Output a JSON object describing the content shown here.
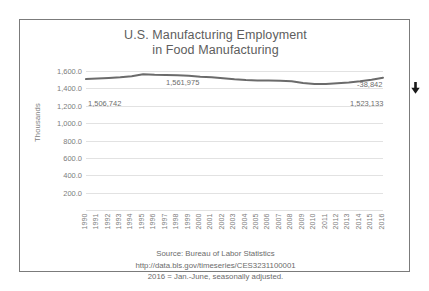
{
  "chart_data": {
    "type": "line",
    "title": "U.S. Manufacturing Employment in Food Manufacturing",
    "title_line1": "U.S. Manufacturing Employment",
    "title_line2": "in Food Manufacturing",
    "xlabel": "",
    "ylabel": "Thousands",
    "ylim": [
      0,
      1600
    ],
    "grid": true,
    "legend": "none",
    "y_ticks": [
      1600.0,
      1400.0,
      1200.0,
      1000.0,
      800.0,
      600.0,
      400.0,
      200.0
    ],
    "y_tick_labels": [
      "1,600.0",
      "1,400.0",
      "1,200.0",
      "1,000.0",
      "800.0",
      "600.0",
      "400.0",
      "200.0"
    ],
    "categories": [
      "1990",
      "1991",
      "1992",
      "1993",
      "1994",
      "1995",
      "1996",
      "1997",
      "1998",
      "1999",
      "2000",
      "2001",
      "2002",
      "2003",
      "2004",
      "2005",
      "2006",
      "2007",
      "2008",
      "2009",
      "2010",
      "2011",
      "2012",
      "2013",
      "2014",
      "2015",
      "2016"
    ],
    "series": [
      {
        "name": "Food Manufacturing Employment",
        "color": "#6b6b6b",
        "units": "thousands",
        "values": [
          1506.7,
          1513.0,
          1520.0,
          1528.0,
          1540.0,
          1562.0,
          1556.0,
          1554.0,
          1552.0,
          1544.0,
          1534.0,
          1528.0,
          1516.0,
          1504.0,
          1496.0,
          1492.0,
          1490.0,
          1488.0,
          1482.0,
          1462.0,
          1450.0,
          1450.0,
          1458.0,
          1468.0,
          1482.0,
          1500.0,
          1523.1
        ]
      }
    ],
    "annotations": [
      {
        "name": "start-value",
        "text": "1,506,742",
        "year": "1990"
      },
      {
        "name": "peak-value",
        "text": "1,561,975",
        "year": "1995"
      },
      {
        "name": "net-change",
        "text": "-38,842",
        "year": "2016"
      },
      {
        "name": "end-value",
        "text": "1,523,133",
        "year": "2016"
      }
    ],
    "marker_icon": "down-arrow-icon"
  },
  "footer": {
    "source": "Source: Bureau of Labor Statistics",
    "url": "http://data.bls.gov/timeseries/CES3231100001",
    "note": "2016 = Jan.-June, seasonally adjusted."
  },
  "colors": {
    "series_line": "#6b6b6b",
    "gridline": "#e2e2e2",
    "text": "#6e6e6e",
    "frame": "#7b7b7b",
    "arrow": "#1a1a1a"
  }
}
